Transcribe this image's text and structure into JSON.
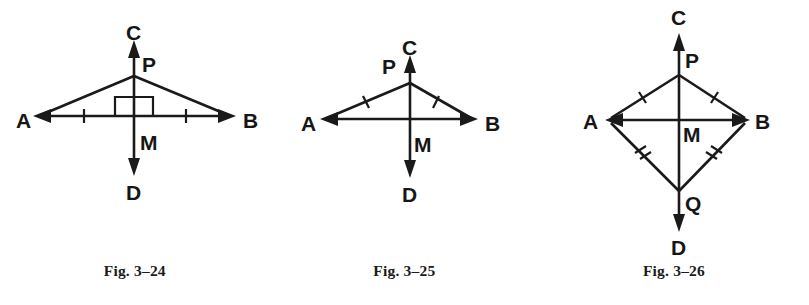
{
  "page": {
    "background_color": "#ffffff",
    "ink_color": "#1a1a1a",
    "width": 809,
    "height": 305
  },
  "figures": [
    {
      "id": "fig-3-24",
      "caption": "Fig. 3–24",
      "description": "Isosceles triangle APB with perpendicular bisector CD through midpoint M of AB",
      "labels": {
        "a": "A",
        "b": "B",
        "c": "C",
        "d": "D",
        "m": "M",
        "p": "P"
      },
      "label_positions": {
        "a": {
          "x": 16,
          "y": 121
        },
        "b": {
          "x": 243,
          "y": 121
        },
        "c": {
          "x": 135,
          "y": 33
        },
        "d": {
          "x": 135,
          "y": 192
        },
        "m": {
          "x": 146,
          "y": 142
        },
        "p": {
          "x": 150,
          "y": 62
        }
      },
      "geometry": {
        "a_point": {
          "x": 33,
          "y": 116
        },
        "b_point": {
          "x": 236,
          "y": 116
        },
        "m_point": {
          "x": 134,
          "y": 116
        },
        "p_point": {
          "x": 134,
          "y": 76
        },
        "c_arrow_tip": {
          "x": 134,
          "y": 40
        },
        "d_arrow_tip": {
          "x": 134,
          "y": 176
        }
      },
      "marks": {
        "ab_ticks": 1,
        "ab_tick_count_sides": 2,
        "side_ticks": 0,
        "right_angle_box": true,
        "right_angle_box_size": 19,
        "arrows": [
          "A",
          "B",
          "C",
          "D"
        ]
      }
    },
    {
      "id": "fig-3-25",
      "caption": "Fig. 3–25",
      "description": "Triangle APB with congruent sides AP and BP marked, line CD through P and M",
      "labels": {
        "a": "A",
        "b": "B",
        "c": "C",
        "d": "D",
        "m": "M",
        "p": "P"
      },
      "label_positions": {
        "a": {
          "x": 31,
          "y": 124
        },
        "b": {
          "x": 215,
          "y": 124
        },
        "c": {
          "x": 140,
          "y": 48
        },
        "d": {
          "x": 140,
          "y": 194
        },
        "m": {
          "x": 150,
          "y": 145
        },
        "p": {
          "x": 112,
          "y": 66
        }
      },
      "geometry": {
        "a_point": {
          "x": 50,
          "y": 119
        },
        "b_point": {
          "x": 208,
          "y": 119
        },
        "m_point": {
          "x": 140,
          "y": 119
        },
        "p_point": {
          "x": 140,
          "y": 83
        },
        "c_arrow_tip": {
          "x": 140,
          "y": 55
        },
        "d_arrow_tip": {
          "x": 140,
          "y": 178
        }
      },
      "marks": {
        "ab_ticks": 0,
        "side_ticks": 1,
        "right_angle_box": false,
        "arrows": [
          "A",
          "B",
          "C",
          "D"
        ]
      }
    },
    {
      "id": "fig-3-26",
      "caption": "Fig. 3–26",
      "description": "Kite APBQ with diagonal CD through P, M and Q; AP=BP single ticks, AQ=BQ double ticks",
      "labels": {
        "a": "A",
        "b": "B",
        "c": "C",
        "d": "D",
        "m": "M",
        "p": "P",
        "q": "Q"
      },
      "label_positions": {
        "a": {
          "x": 44,
          "y": 110
        },
        "b": {
          "x": 216,
          "y": 110
        },
        "c": {
          "x": 140,
          "y": 8
        },
        "d": {
          "x": 140,
          "y": 238
        },
        "m": {
          "x": 150,
          "y": 126
        },
        "p": {
          "x": 153,
          "y": 52
        },
        "q": {
          "x": 153,
          "y": 194
        }
      },
      "geometry": {
        "a_point": {
          "x": 66,
          "y": 120
        },
        "b_point": {
          "x": 211,
          "y": 120
        },
        "m_point": {
          "x": 140,
          "y": 120
        },
        "p_point": {
          "x": 140,
          "y": 75
        },
        "q_point": {
          "x": 140,
          "y": 191
        },
        "c_arrow_tip": {
          "x": 140,
          "y": 33
        },
        "d_arrow_tip": {
          "x": 140,
          "y": 232
        }
      },
      "marks": {
        "ab_ticks": 0,
        "upper_side_ticks": 1,
        "lower_side_ticks": 2,
        "right_angle_box": false,
        "arrows": [
          "A",
          "B",
          "C",
          "D"
        ]
      }
    }
  ],
  "caption_style": {
    "y_position": 262
  }
}
